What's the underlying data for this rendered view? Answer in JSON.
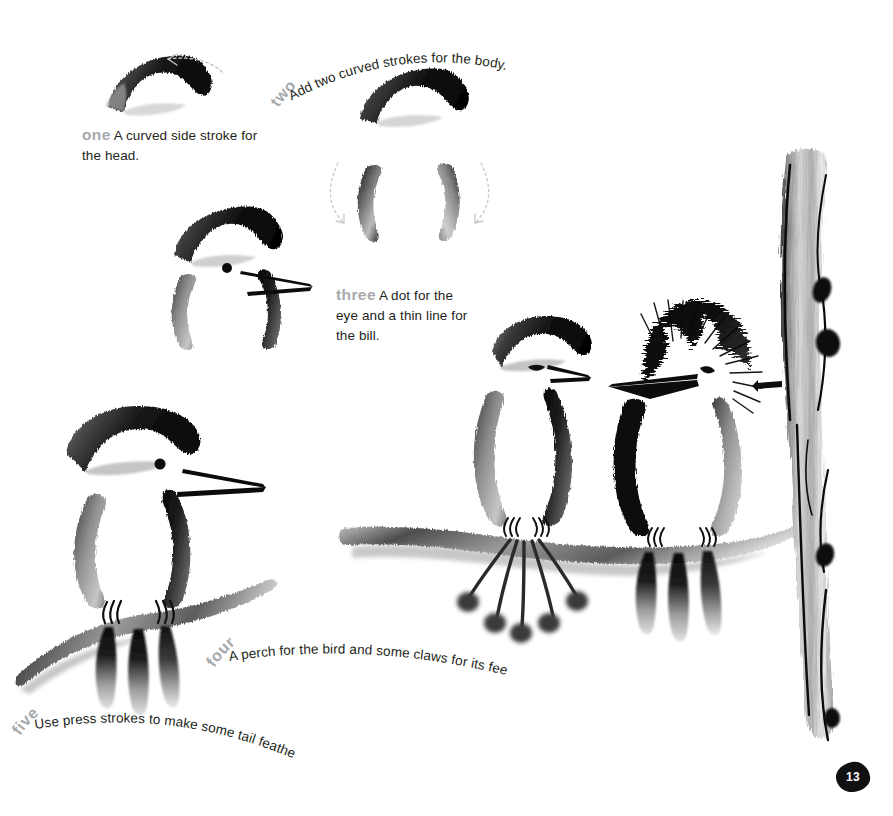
{
  "page": {
    "number": "13",
    "background_color": "#ffffff",
    "ink_color": "#1a1a1a",
    "step_label_color": "#a7a9ac",
    "body_text_color": "#231f20",
    "arrow_color": "#c9c9c9"
  },
  "steps": [
    {
      "id": "one",
      "number_label": "one",
      "text": "A curved side stroke for the head.",
      "text_line_1": "A curved side stroke for",
      "text_line_2": "the head.",
      "layout": "straight",
      "arrow": "curved-dotted-arrow-left"
    },
    {
      "id": "two",
      "number_label": "two",
      "text": "Add two curved strokes for the body.",
      "layout": "arc",
      "arrow": "two-curved-dotted-arrows-down"
    },
    {
      "id": "three",
      "number_label": "three",
      "text": "A dot for the eye and a thin line for the bill.",
      "text_line_1": "A dot for the",
      "text_line_2": "eye and a thin line for",
      "text_line_3": "the bill.",
      "layout": "straight",
      "arrow": "none"
    },
    {
      "id": "four",
      "number_label": "four",
      "text": "A perch for the bird and some claws for its feet.",
      "layout": "arc",
      "arrow": "none"
    },
    {
      "id": "five",
      "number_label": "five",
      "text": "Use press strokes to make some tail feathers.",
      "layout": "arc",
      "arrow": "none"
    }
  ],
  "artwork": {
    "elements": [
      "head-stroke-step-one",
      "body-strokes-step-two",
      "bird-with-eye-and-bill-step-three",
      "bird-on-perch-with-claws-and-tail-step-four-five",
      "finished-bird-pair-on-branch",
      "crested-bird",
      "tree-trunk"
    ],
    "description": "Sumi-e ink brush painting demonstration of a perched bird built up in five strokes, with two finished birds sitting on a branch beside a textured tree trunk."
  },
  "page_badge": {
    "label": "13"
  }
}
